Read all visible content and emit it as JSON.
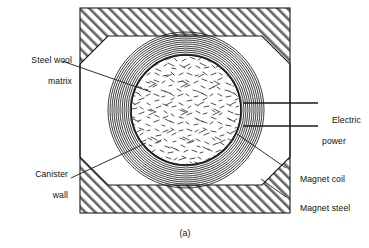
{
  "figure": {
    "caption": "(a)",
    "colors": {
      "line": "#1a1a1a",
      "hatch": "#555555",
      "matrix": "#7a7a7a",
      "background": "#ffffff"
    }
  },
  "labels": {
    "steel_wool_matrix": {
      "line1": "Steel wool",
      "line2": "matrix"
    },
    "canister_wall": {
      "line1": "Canister",
      "line2": "wall"
    },
    "electric_power": {
      "line1": "Electric",
      "line2": "power"
    },
    "magnet_coil": {
      "line1": "Magnet coil"
    },
    "magnet_steel": {
      "line1": "Magnet steel"
    }
  },
  "parts": {
    "magnet_steel_body": "magnet-steel-hatched-block",
    "magnet_coil_windings": "concentric-coil-rings",
    "canister_wall_ring": "canister-wall-circle",
    "steel_wool_fill": "steel-wool-stipple",
    "electric_power_leads": "two-horizontal-lead-lines"
  },
  "geometry": {
    "outer_box": {
      "x": 80,
      "y": 8,
      "width": 210,
      "height": 205
    },
    "octagon_inset": 28,
    "coil_center": {
      "cx": 186,
      "cy": 110
    },
    "coil_outer_radius": 78,
    "coil_inner_radius": 56,
    "coil_ring_count": 12,
    "matrix_radius": 54,
    "lead_y_top": 103,
    "lead_y_bottom": 126
  }
}
